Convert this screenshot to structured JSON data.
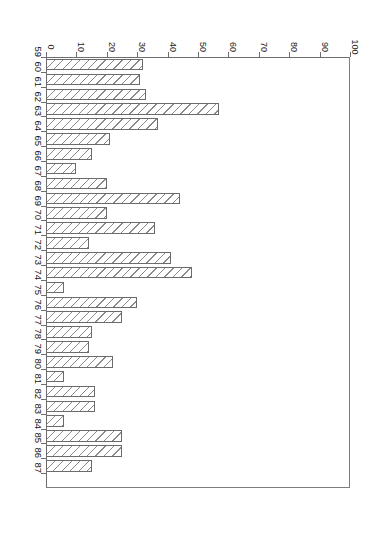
{
  "chart": {
    "title": "",
    "orientation": "horizontal-bar-rotated",
    "axis_value_label": "",
    "axis_category_label": ""
  },
  "chart_data": {
    "type": "bar",
    "title": "",
    "xlabel": "",
    "ylabel": "",
    "orientation": "horizontal",
    "grid": false,
    "legend": false,
    "xlim": [
      0,
      100
    ],
    "xticks": [
      0,
      10,
      20,
      30,
      40,
      50,
      60,
      70,
      80,
      90,
      100
    ],
    "categories": [
      "59",
      "60",
      "61",
      "62",
      "63",
      "64",
      "65",
      "66",
      "67",
      "68",
      "69",
      "70",
      "71",
      "72",
      "73",
      "74",
      "75",
      "76",
      "77",
      "78",
      "79",
      "80",
      "81",
      "82",
      "83",
      "84",
      "85",
      "86",
      "87"
    ],
    "values": [
      32,
      31,
      33,
      57,
      37,
      21,
      15,
      10,
      20,
      44,
      20,
      36,
      14,
      41,
      48,
      6,
      30,
      25,
      15,
      14,
      22,
      6,
      16,
      16,
      6,
      25,
      25,
      15,
      27
    ],
    "bar_style": {
      "fill": "diagonal-hatch",
      "edge_color": "#6b6b6b",
      "hatch_color": "#8a8a8a",
      "face_color": "#ffffff"
    }
  }
}
